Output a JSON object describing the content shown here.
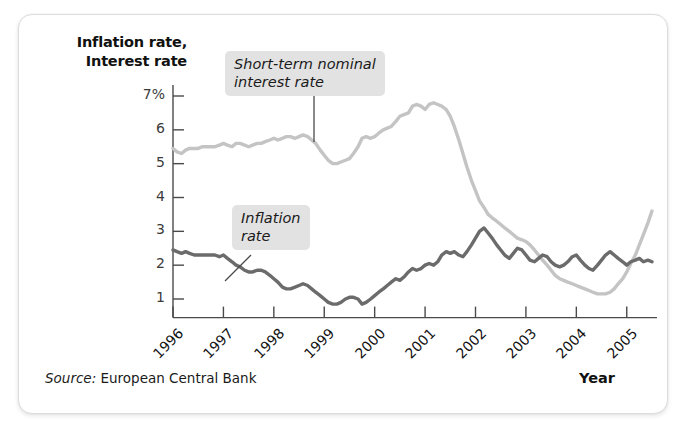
{
  "axis": {
    "y_title_line1": "Inflation rate,",
    "y_title_line2": "Interest rate",
    "x_title": "Year"
  },
  "source": {
    "label": "Source:",
    "text": "European Central Bank"
  },
  "annotations": {
    "interest_line1": "Short-term nominal",
    "interest_line2": "interest rate",
    "inflation_line1": "Inflation",
    "inflation_line2": "rate"
  },
  "colors": {
    "interest_rate": "#c4c4c4",
    "inflation_rate": "#6b6b6b",
    "axis": "#4a4a4a",
    "callout_bg": "#e2e2e2",
    "card_border": "#dcdcdc"
  },
  "chart_data": {
    "type": "line",
    "title": "",
    "xlabel": "Year",
    "ylabel": "Inflation rate, Interest rate",
    "xlim": [
      1996,
      2005.6
    ],
    "ylim": [
      0.45,
      7.35
    ],
    "grid": false,
    "legend": "annotated-callouts",
    "ytick_labels": [
      "7%",
      "6",
      "5",
      "4",
      "3",
      "2",
      "1"
    ],
    "ytick_values": [
      7,
      6,
      5,
      4,
      3,
      2,
      1
    ],
    "xtick_labels": [
      "1996",
      "1997",
      "1998",
      "1999",
      "2000",
      "2001",
      "2002",
      "2003",
      "2004",
      "2005"
    ],
    "xtick_values": [
      1996,
      1997,
      1998,
      1999,
      2000,
      2001,
      2002,
      2003,
      2004,
      2005
    ],
    "series": [
      {
        "name": "Short-term nominal interest rate",
        "color": "#c4c4c4",
        "x": [
          1996.0,
          1996.08,
          1996.17,
          1996.25,
          1996.33,
          1996.42,
          1996.5,
          1996.58,
          1996.67,
          1996.75,
          1996.83,
          1996.92,
          1997.0,
          1997.08,
          1997.17,
          1997.25,
          1997.33,
          1997.42,
          1997.5,
          1997.58,
          1997.67,
          1997.75,
          1997.83,
          1997.92,
          1998.0,
          1998.08,
          1998.17,
          1998.25,
          1998.33,
          1998.42,
          1998.5,
          1998.58,
          1998.67,
          1998.75,
          1998.83,
          1998.92,
          1999.0,
          1999.08,
          1999.17,
          1999.25,
          1999.33,
          1999.42,
          1999.5,
          1999.58,
          1999.67,
          1999.75,
          1999.83,
          1999.92,
          2000.0,
          2000.08,
          2000.17,
          2000.25,
          2000.33,
          2000.42,
          2000.5,
          2000.58,
          2000.67,
          2000.75,
          2000.83,
          2000.92,
          2001.0,
          2001.08,
          2001.17,
          2001.25,
          2001.33,
          2001.42,
          2001.5,
          2001.58,
          2001.67,
          2001.75,
          2001.83,
          2001.92,
          2002.0,
          2002.08,
          2002.17,
          2002.25,
          2002.33,
          2002.42,
          2002.5,
          2002.58,
          2002.67,
          2002.75,
          2002.83,
          2002.92,
          2003.0,
          2003.08,
          2003.17,
          2003.25,
          2003.33,
          2003.42,
          2003.5,
          2003.58,
          2003.67,
          2003.75,
          2003.83,
          2003.92,
          2004.0,
          2004.08,
          2004.17,
          2004.25,
          2004.33,
          2004.42,
          2004.5,
          2004.58,
          2004.67,
          2004.75,
          2004.83,
          2004.92,
          2005.0,
          2005.08,
          2005.17,
          2005.25,
          2005.33,
          2005.42,
          2005.5
        ],
        "y": [
          5.45,
          5.35,
          5.3,
          5.4,
          5.45,
          5.45,
          5.45,
          5.5,
          5.5,
          5.5,
          5.5,
          5.55,
          5.6,
          5.55,
          5.5,
          5.6,
          5.6,
          5.55,
          5.5,
          5.55,
          5.6,
          5.6,
          5.65,
          5.7,
          5.75,
          5.7,
          5.75,
          5.8,
          5.8,
          5.75,
          5.8,
          5.85,
          5.8,
          5.7,
          5.6,
          5.4,
          5.25,
          5.1,
          5.0,
          5.0,
          5.05,
          5.1,
          5.15,
          5.3,
          5.5,
          5.75,
          5.8,
          5.75,
          5.8,
          5.9,
          6.0,
          6.05,
          6.1,
          6.25,
          6.4,
          6.45,
          6.5,
          6.7,
          6.75,
          6.7,
          6.6,
          6.75,
          6.8,
          6.75,
          6.7,
          6.6,
          6.4,
          6.1,
          5.7,
          5.3,
          4.9,
          4.5,
          4.2,
          3.9,
          3.7,
          3.5,
          3.4,
          3.3,
          3.2,
          3.1,
          3.0,
          2.9,
          2.8,
          2.75,
          2.7,
          2.6,
          2.45,
          2.3,
          2.15,
          2.0,
          1.85,
          1.7,
          1.6,
          1.55,
          1.5,
          1.45,
          1.4,
          1.35,
          1.3,
          1.25,
          1.2,
          1.15,
          1.15,
          1.15,
          1.2,
          1.3,
          1.45,
          1.6,
          1.8,
          2.05,
          2.3,
          2.6,
          2.9,
          3.25,
          3.6
        ]
      },
      {
        "name": "Inflation rate",
        "color": "#6b6b6b",
        "x": [
          1996.0,
          1996.08,
          1996.17,
          1996.25,
          1996.33,
          1996.42,
          1996.5,
          1996.58,
          1996.67,
          1996.75,
          1996.83,
          1996.92,
          1997.0,
          1997.08,
          1997.17,
          1997.25,
          1997.33,
          1997.42,
          1997.5,
          1997.58,
          1997.67,
          1997.75,
          1997.83,
          1997.92,
          1998.0,
          1998.08,
          1998.17,
          1998.25,
          1998.33,
          1998.42,
          1998.5,
          1998.58,
          1998.67,
          1998.75,
          1998.83,
          1998.92,
          1999.0,
          1999.08,
          1999.17,
          1999.25,
          1999.33,
          1999.42,
          1999.5,
          1999.58,
          1999.67,
          1999.75,
          1999.83,
          1999.92,
          2000.0,
          2000.08,
          2000.17,
          2000.25,
          2000.33,
          2000.42,
          2000.5,
          2000.58,
          2000.67,
          2000.75,
          2000.83,
          2000.92,
          2001.0,
          2001.08,
          2001.17,
          2001.25,
          2001.33,
          2001.42,
          2001.5,
          2001.58,
          2001.67,
          2001.75,
          2001.83,
          2001.92,
          2002.0,
          2002.08,
          2002.17,
          2002.25,
          2002.33,
          2002.42,
          2002.5,
          2002.58,
          2002.67,
          2002.75,
          2002.83,
          2002.92,
          2003.0,
          2003.08,
          2003.17,
          2003.25,
          2003.33,
          2003.42,
          2003.5,
          2003.58,
          2003.67,
          2003.75,
          2003.83,
          2003.92,
          2004.0,
          2004.08,
          2004.17,
          2004.25,
          2004.33,
          2004.42,
          2004.5,
          2004.58,
          2004.67,
          2004.75,
          2004.83,
          2004.92,
          2005.0,
          2005.08,
          2005.17,
          2005.25,
          2005.33,
          2005.42,
          2005.5
        ],
        "y": [
          2.45,
          2.4,
          2.35,
          2.4,
          2.35,
          2.3,
          2.3,
          2.3,
          2.3,
          2.3,
          2.3,
          2.25,
          2.3,
          2.2,
          2.1,
          2.0,
          1.95,
          1.85,
          1.8,
          1.8,
          1.85,
          1.85,
          1.8,
          1.7,
          1.6,
          1.5,
          1.35,
          1.3,
          1.3,
          1.35,
          1.4,
          1.45,
          1.4,
          1.3,
          1.2,
          1.1,
          1.0,
          0.9,
          0.85,
          0.85,
          0.9,
          1.0,
          1.05,
          1.05,
          1.0,
          0.85,
          0.9,
          1.0,
          1.1,
          1.2,
          1.3,
          1.4,
          1.5,
          1.6,
          1.55,
          1.65,
          1.8,
          1.9,
          1.85,
          1.9,
          2.0,
          2.05,
          2.0,
          2.1,
          2.3,
          2.4,
          2.35,
          2.4,
          2.3,
          2.25,
          2.4,
          2.6,
          2.8,
          3.0,
          3.1,
          2.95,
          2.8,
          2.6,
          2.45,
          2.3,
          2.2,
          2.35,
          2.5,
          2.45,
          2.3,
          2.15,
          2.1,
          2.2,
          2.3,
          2.25,
          2.1,
          2.0,
          1.95,
          2.0,
          2.1,
          2.25,
          2.3,
          2.15,
          2.0,
          1.9,
          1.85,
          2.0,
          2.15,
          2.3,
          2.4,
          2.3,
          2.2,
          2.1,
          2.0,
          2.1,
          2.15,
          2.2,
          2.1,
          2.15,
          2.1
        ]
      }
    ]
  }
}
